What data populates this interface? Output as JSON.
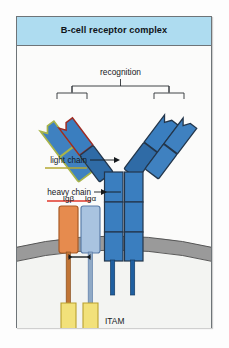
{
  "figure": {
    "title": "B-cell receptor complex",
    "title_band_color": "#aedcf0",
    "frame_color": "#6e7478",
    "background": "#fbfbfa"
  },
  "labels": {
    "recognition": "recognition",
    "light_chain": "light chain",
    "heavy_chain": "heavy chain",
    "ig_beta": "Igβ",
    "ig_alpha": "Igα",
    "itam": "ITAM",
    "signaling": "signaling"
  },
  "underlines": {
    "light_chain_color": "#b5a832",
    "heavy_chain_color": "#e0372a"
  },
  "colors": {
    "domain_blue": "#3a7ebf",
    "domain_blue_dark": "#2f6ba6",
    "light_chain_outline": "#a8b44a",
    "heavy_chain_outline": "#9e2b22",
    "ig_beta_fill": "#e68b4e",
    "ig_beta_stroke": "#a85a25",
    "ig_alpha_fill": "#a9c3e0",
    "ig_alpha_stroke": "#5b7da8",
    "itam_fill": "#f2e17a",
    "itam_stroke": "#b9a02e",
    "membrane_fill": "#9a9a9a",
    "membrane_stroke": "#4c4c4c",
    "cytoplasm_fill": "#f3f4f2",
    "bracket_color": "#2a2f33",
    "leader_color": "#15191c"
  },
  "structure": {
    "arms": [
      {
        "name": "left-arm",
        "chains": [
          "light-chain",
          "heavy-chain"
        ],
        "domains_per_chain": 2
      },
      {
        "name": "right-arm",
        "chains": [
          "heavy-chain",
          "light-chain"
        ],
        "domains_per_chain": 2
      }
    ],
    "stem_chains": 2,
    "stem_domains_per_chain": 3,
    "accessory_chains": [
      "Igβ",
      "Igα"
    ],
    "itam_count": 2
  }
}
